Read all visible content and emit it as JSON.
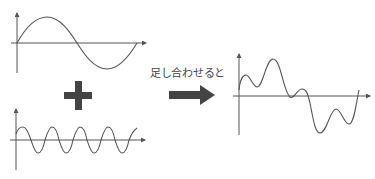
{
  "diagram": {
    "caption": "足し合わせると",
    "colors": {
      "line": "#555555",
      "symbol": "#444444",
      "background": "#ffffff"
    },
    "panels": [
      {
        "name": "low-frequency-sine",
        "description": "1 cycle sine wave",
        "cycles": 1
      },
      {
        "name": "high-frequency-sine",
        "description": "4 cycle sine wave",
        "cycles": 4
      },
      {
        "name": "composite-wave",
        "description": "sum of the two sine waves"
      }
    ],
    "operators": {
      "plus": "+",
      "arrow": "→"
    }
  }
}
